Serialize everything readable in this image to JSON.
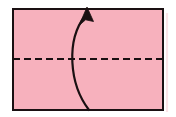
{
  "figure": {
    "kind": "origami-fold-diagram",
    "canvas": {
      "width": 176,
      "height": 117,
      "background": "#ffffff"
    }
  },
  "colors": {
    "paper_fill": "#f7b1bd",
    "paper_stroke": "#1a1012",
    "shadow_stroke": "#fbe4e7",
    "crease_stroke": "#1a1012",
    "arrow_stroke": "#1a1012"
  },
  "paper": {
    "name": "rectangular-sheet",
    "x": 13,
    "y": 9,
    "width": 150,
    "height": 101,
    "stroke_width": 2.4,
    "fill": "#f7b1bd"
  },
  "shadow": {
    "name": "sheet-edge-shadow",
    "x": 166,
    "y": 13,
    "width": 2,
    "height": 99,
    "stroke": "#fbe4e7"
  },
  "crease": {
    "name": "horizontal-valley-crease",
    "style": "dashed",
    "x1": 13,
    "x2": 163,
    "y": 59,
    "stroke_width": 2.2,
    "dash_length": 7,
    "gap_length": 4
  },
  "arrow": {
    "name": "fold-direction-arrow",
    "direction": "bottom-to-top",
    "curve": "M 89 110 C 69 84, 66 40, 85 16",
    "stroke_width": 2.2,
    "head_points": "87.0,7.5 80.0,24.5 86.0,19.5 93.0,21.0",
    "tail_x": 89,
    "tail_y": 110,
    "tip_x": 87,
    "tip_y": 8
  },
  "labels": {
    "paper_label": "",
    "crease_label": "",
    "arrow_label": ""
  }
}
